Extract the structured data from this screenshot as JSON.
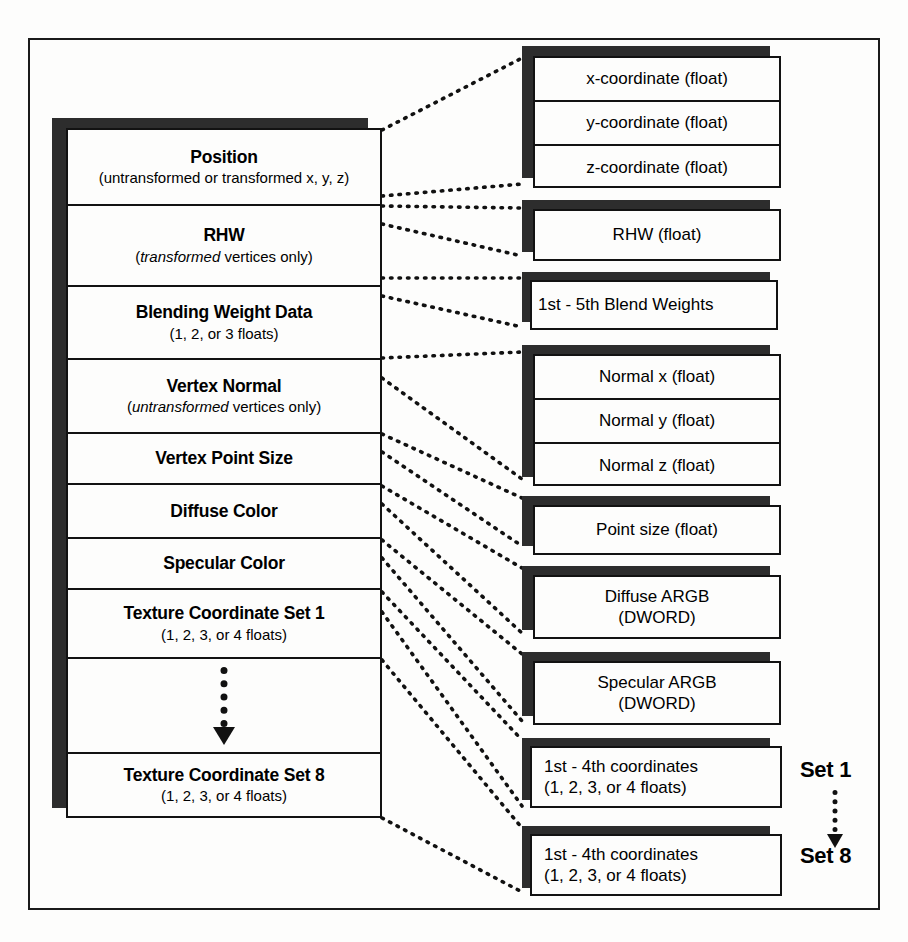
{
  "diagram": {
    "accent_color": "#121212",
    "shadow_color": "#2d2d2d"
  },
  "vertex_column": {
    "rows": [
      {
        "name": "position",
        "title": "Position",
        "subtitle_pre": "(untransformed or transformed x, y, z)",
        "subtitle_em": "",
        "subtitle_post": ""
      },
      {
        "name": "rhw",
        "title": "RHW",
        "subtitle_pre": "(",
        "subtitle_em": "transformed",
        "subtitle_post": " vertices only)"
      },
      {
        "name": "blending-weight-data",
        "title": "Blending Weight Data",
        "subtitle_pre": "(1, 2, or 3 floats)",
        "subtitle_em": "",
        "subtitle_post": ""
      },
      {
        "name": "vertex-normal",
        "title": "Vertex Normal",
        "subtitle_pre": "(",
        "subtitle_em": "untransformed",
        "subtitle_post": " vertices only)"
      },
      {
        "name": "vertex-point-size",
        "title": "Vertex Point Size",
        "subtitle_pre": "",
        "subtitle_em": "",
        "subtitle_post": ""
      },
      {
        "name": "diffuse-color",
        "title": "Diffuse Color",
        "subtitle_pre": "",
        "subtitle_em": "",
        "subtitle_post": ""
      },
      {
        "name": "specular-color",
        "title": "Specular Color",
        "subtitle_pre": "",
        "subtitle_em": "",
        "subtitle_post": ""
      },
      {
        "name": "texture-coordinate-set-1",
        "title": "Texture Coordinate Set 1",
        "subtitle_pre": "(1, 2, 3, or 4 floats)",
        "subtitle_em": "",
        "subtitle_post": ""
      },
      {
        "name": "ellipsis-row",
        "title": "",
        "subtitle_pre": "",
        "subtitle_em": "",
        "subtitle_post": ""
      },
      {
        "name": "texture-coordinate-set-8",
        "title": "Texture Coordinate Set 8",
        "subtitle_pre": "(1, 2, 3, or 4 floats)",
        "subtitle_em": "",
        "subtitle_post": ""
      }
    ]
  },
  "detail_boxes": {
    "position": {
      "cells": [
        "x-coordinate (float)",
        "y-coordinate (float)",
        "z-coordinate (float)"
      ]
    },
    "rhw": {
      "line1": "RHW (float)",
      "line2": ""
    },
    "blend": {
      "line1": "1st - 5th Blend Weights",
      "line2": ""
    },
    "normal": {
      "cells": [
        "Normal x (float)",
        "Normal y (float)",
        "Normal z (float)"
      ]
    },
    "point_size": {
      "line1": "Point size (float)",
      "line2": ""
    },
    "diffuse": {
      "line1": "Diffuse ARGB",
      "line2": "(DWORD)"
    },
    "specular": {
      "line1": "Specular ARGB",
      "line2": "(DWORD)"
    },
    "texcoord_1": {
      "line1": "1st - 4th coordinates",
      "line2": "(1, 2, 3, or 4 floats)"
    },
    "texcoord_8": {
      "line1": "1st - 4th coordinates",
      "line2": "(1, 2, 3, or 4 floats)"
    }
  },
  "set_labels": {
    "first": "Set 1",
    "last": "Set 8"
  }
}
